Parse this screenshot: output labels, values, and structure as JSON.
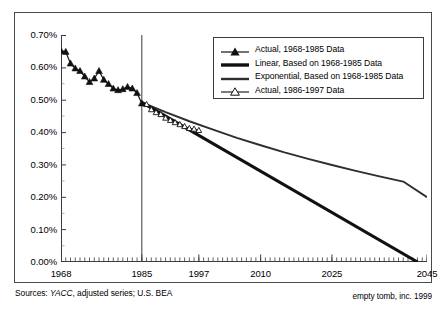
{
  "chart_data": {
    "type": "line",
    "title": "",
    "xlabel": "",
    "ylabel": "",
    "xlim": [
      1968,
      2045
    ],
    "ylim": [
      0.0,
      0.7
    ],
    "grid": false,
    "legend_position": "top-right",
    "ytick_labels": [
      "0.70%",
      "0.60%",
      "0.50%",
      "0.40%",
      "0.30%",
      "0.20%",
      "0.10%",
      "0.00%"
    ],
    "ytick_values": [
      0.7,
      0.6,
      0.5,
      0.4,
      0.3,
      0.2,
      0.1,
      0.0
    ],
    "xtick_labels": [
      "1968",
      "1985",
      "1997",
      "2010",
      "2025",
      "2045"
    ],
    "xtick_values": [
      1968,
      1985,
      1997,
      2010,
      2025,
      2045
    ],
    "annotations": [
      {
        "type": "vertical-line",
        "x": 1985,
        "label": "1985 divider"
      }
    ],
    "series": [
      {
        "name": "Actual, 1968-1985 Data",
        "marker": "filled-triangle",
        "style": "solid-thin",
        "x": [
          1968,
          1969,
          1970,
          1971,
          1972,
          1973,
          1974,
          1975,
          1976,
          1977,
          1978,
          1979,
          1980,
          1981,
          1982,
          1983,
          1984,
          1985
        ],
        "values": [
          0.651,
          0.648,
          0.612,
          0.597,
          0.589,
          0.572,
          0.555,
          0.566,
          0.589,
          0.562,
          0.549,
          0.535,
          0.53,
          0.533,
          0.54,
          0.535,
          0.521,
          0.489
        ]
      },
      {
        "name": "Linear, Based on 1968-1985 Data",
        "marker": "none",
        "style": "solid-thick",
        "x": [
          1985,
          2043
        ],
        "values": [
          0.492,
          0.0
        ]
      },
      {
        "name": "Exponential, Based on 1968-1985 Data",
        "marker": "none",
        "style": "solid-medium",
        "x": [
          1985,
          1990,
          1995,
          2000,
          2005,
          2010,
          2015,
          2020,
          2025,
          2030,
          2035,
          2040,
          2045
        ],
        "values": [
          0.492,
          0.462,
          0.434,
          0.408,
          0.383,
          0.36,
          0.338,
          0.318,
          0.299,
          0.281,
          0.264,
          0.248,
          0.2
        ]
      },
      {
        "name": "Actual, 1986-1997 Data",
        "marker": "hollow-triangle",
        "style": "solid-thin",
        "x": [
          1986,
          1987,
          1988,
          1989,
          1990,
          1991,
          1992,
          1993,
          1994,
          1995,
          1996,
          1997
        ],
        "values": [
          0.486,
          0.47,
          0.461,
          0.455,
          0.444,
          0.437,
          0.43,
          0.424,
          0.418,
          0.412,
          0.41,
          0.406
        ]
      }
    ]
  },
  "legend": {
    "items": [
      {
        "label": "Actual, 1968-1985 Data",
        "key": "filled-triangle-line-key"
      },
      {
        "label": "Linear, Based on 1968-1985 Data",
        "key": "thick-line-key"
      },
      {
        "label": "Exponential, Based on 1968-1985 Data",
        "key": "medium-line-key"
      },
      {
        "label": "Actual, 1986-1997 Data",
        "key": "hollow-triangle-line-key"
      }
    ]
  },
  "captions": {
    "sources_prefix": "Sources: ",
    "sources_italic": "YACC",
    "sources_suffix": ", adjusted series; U.S. BEA",
    "credit": "empty tomb, inc. 1999"
  },
  "colors": {
    "axis": "#3c3c3c",
    "frame": "#4a4a4a",
    "series_actual": "#111111",
    "series_linear": "#111111",
    "series_exponential": "#2e2e2e",
    "background": "#ffffff"
  }
}
